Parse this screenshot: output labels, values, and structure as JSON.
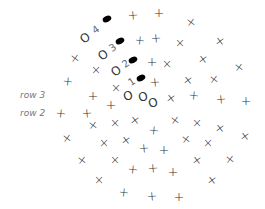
{
  "diagram": {
    "type": "crochet-stitch-chart",
    "row_labels": [
      {
        "text": "row 3",
        "x": 20,
        "y": 95
      },
      {
        "text": "row 2",
        "x": 20,
        "y": 113
      }
    ],
    "chain_markers": [
      {
        "label": "4",
        "o_x": 85,
        "o_y": 38,
        "num_x": 96,
        "num_y": 30,
        "dot_x": 107,
        "dot_y": 19
      },
      {
        "label": "3",
        "o_x": 103,
        "o_y": 55,
        "num_x": 113,
        "num_y": 48,
        "dot_x": 120,
        "dot_y": 41
      },
      {
        "label": "2",
        "o_x": 116,
        "o_y": 71,
        "num_x": 126,
        "num_y": 64,
        "dot_x": 133,
        "dot_y": 60
      },
      {
        "label": "1",
        "o_x": null,
        "o_y": null,
        "num_x": 132,
        "num_y": 82,
        "dot_x": 141,
        "dot_y": 78
      }
    ],
    "chain_stitches": [
      {
        "x": 128,
        "y": 96
      },
      {
        "x": 143,
        "y": 97
      },
      {
        "x": 153,
        "y": 103
      }
    ],
    "stitch_symbols": {
      "plus": "+",
      "cross": "×",
      "chain": "O"
    },
    "plus_stitches": [
      [
        133,
        15
      ],
      [
        159,
        12
      ],
      [
        140,
        40
      ],
      [
        156,
        38
      ],
      [
        152,
        61
      ],
      [
        68,
        81
      ],
      [
        155,
        82
      ],
      [
        93,
        95
      ],
      [
        194,
        95
      ],
      [
        221,
        99
      ],
      [
        246,
        100
      ],
      [
        61,
        113
      ],
      [
        87,
        113
      ],
      [
        111,
        104
      ],
      [
        154,
        130
      ],
      [
        144,
        148
      ],
      [
        164,
        149
      ],
      [
        133,
        169
      ],
      [
        153,
        168
      ],
      [
        173,
        171
      ],
      [
        124,
        192
      ],
      [
        152,
        196
      ],
      [
        179,
        196
      ]
    ],
    "cross_stitches": [
      [
        191,
        22
      ],
      [
        180,
        43
      ],
      [
        220,
        41
      ],
      [
        75,
        58
      ],
      [
        167,
        64
      ],
      [
        203,
        59
      ],
      [
        239,
        67
      ],
      [
        96,
        70
      ],
      [
        188,
        80
      ],
      [
        214,
        79
      ],
      [
        116,
        88
      ],
      [
        171,
        98
      ],
      [
        93,
        125
      ],
      [
        115,
        123
      ],
      [
        135,
        120
      ],
      [
        175,
        120
      ],
      [
        197,
        123
      ],
      [
        220,
        128
      ],
      [
        67,
        138
      ],
      [
        104,
        143
      ],
      [
        126,
        140
      ],
      [
        186,
        139
      ],
      [
        208,
        143
      ],
      [
        245,
        136
      ],
      [
        82,
        160
      ],
      [
        115,
        160
      ],
      [
        197,
        160
      ],
      [
        230,
        159
      ],
      [
        99,
        180
      ],
      [
        212,
        180
      ]
    ]
  }
}
